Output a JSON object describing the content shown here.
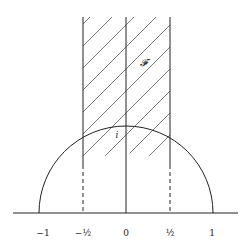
{
  "diagram": {
    "region_label": "𝓕",
    "point_label": "i",
    "axis_ticks": [
      {
        "value": -1,
        "label": "−1",
        "x": 43
      },
      {
        "value": -0.5,
        "label": "−½",
        "x": 83
      },
      {
        "value": 0,
        "label": "0",
        "x": 126
      },
      {
        "value": 0.5,
        "label": "½",
        "x": 170
      },
      {
        "value": 1,
        "label": "1",
        "x": 212
      }
    ],
    "colors": {
      "line": "#222222",
      "hatch": "#555555",
      "background": "#ffffff"
    }
  }
}
